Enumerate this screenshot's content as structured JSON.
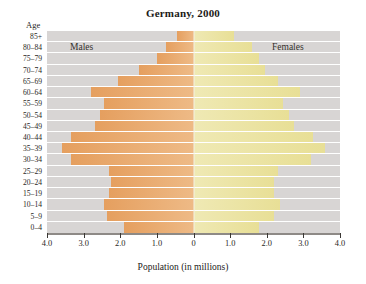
{
  "chart_data": {
    "type": "bar",
    "subtype": "population-pyramid",
    "title": "Germany, 2000",
    "xlabel": "Population (in millions)",
    "ylabel": "Age",
    "xlim": [
      -4.0,
      4.0
    ],
    "xticks": [
      "4.0",
      "3.0",
      "2.0",
      "1.0",
      "0",
      "1.0",
      "2.0",
      "3.0",
      "4.0"
    ],
    "xtick_values": [
      -4.0,
      -3.0,
      -2.0,
      -1.0,
      0,
      1.0,
      2.0,
      3.0,
      4.0
    ],
    "grid": true,
    "legend_position": "in-plot",
    "categories": [
      "85+",
      "80–84",
      "75–79",
      "70–74",
      "65–69",
      "60–64",
      "55–59",
      "50–54",
      "45–49",
      "40–44",
      "35–39",
      "30–34",
      "25–29",
      "20–24",
      "15–19",
      "10–14",
      "5–9",
      "0–4"
    ],
    "series": [
      {
        "name": "Males",
        "color": "#e9a96d",
        "values": [
          0.45,
          0.75,
          1.0,
          1.5,
          2.05,
          2.8,
          2.45,
          2.55,
          2.7,
          3.35,
          3.6,
          3.35,
          2.3,
          2.25,
          2.3,
          2.45,
          2.35,
          1.9
        ]
      },
      {
        "name": "Females",
        "color": "#ece5a6",
        "values": [
          1.1,
          1.6,
          1.8,
          1.95,
          2.3,
          2.9,
          2.45,
          2.6,
          2.75,
          3.25,
          3.6,
          3.2,
          2.3,
          2.2,
          2.2,
          2.35,
          2.2,
          1.8
        ]
      }
    ],
    "plot_background": "#d8d5d4",
    "gridline_color": "#ffffff",
    "zero_line_color": "#f4f1e4"
  },
  "labels": {
    "age_caption": "Age",
    "males": "Males",
    "females": "Females"
  }
}
